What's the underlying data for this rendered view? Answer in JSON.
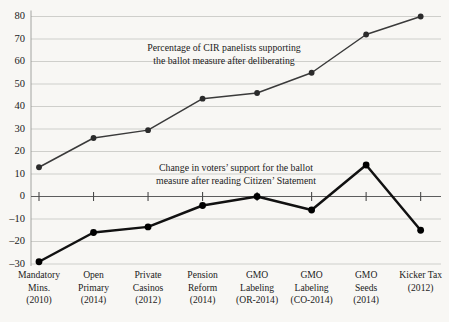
{
  "chart_data": {
    "type": "line",
    "title": "",
    "xlabel": "",
    "ylabel": "",
    "ylim": [
      -30,
      80
    ],
    "ytick_step": 10,
    "grid": true,
    "legend_position": "inline-annotations",
    "categories": [
      "Mandatory Mins. (2010)",
      "Open Primary (2014)",
      "Private Casinos (2012)",
      "Pension Reform (2014)",
      "GMO Labeling (OR-2014)",
      "GMO Labeling (CO-2014)",
      "GMO Seeds (2014)",
      "Kicker Tax (2012)"
    ],
    "category_lines": [
      [
        "Mandatory",
        "Mins.",
        "(2010)"
      ],
      [
        "Open",
        "Primary",
        "(2014)"
      ],
      [
        "Private",
        "Casinos",
        "(2012)"
      ],
      [
        "Pension",
        "Reform",
        "(2014)"
      ],
      [
        "GMO",
        "Labeling",
        "(OR-2014)"
      ],
      [
        "GMO",
        "Labeling",
        "(CO-2014)"
      ],
      [
        "GMO",
        "Seeds",
        "(2014)"
      ],
      [
        "Kicker Tax",
        "(2012)",
        ""
      ]
    ],
    "yticks": [
      80,
      70,
      60,
      50,
      40,
      30,
      20,
      10,
      0,
      -10,
      -20,
      -30
    ],
    "ytick_labels": [
      "80",
      "70",
      "60",
      "50",
      "40",
      "30",
      "20",
      "10",
      "0",
      "–10",
      "–20",
      "–30"
    ],
    "series": [
      {
        "name": "Percentage of CIR panelists supporting the ballot measure after deliberating",
        "values": [
          13,
          26,
          29.5,
          43.5,
          46,
          55,
          72,
          80
        ],
        "color": "#3a3a3a"
      },
      {
        "name": "Change in voters' support for the ballot measure after reading Citizen' Statement",
        "values": [
          -29,
          -16,
          -13.5,
          -4,
          0,
          -6,
          14,
          -15
        ],
        "color": "#111111"
      }
    ],
    "annotations": [
      {
        "id": "upper-series-annotation",
        "lines": [
          "Percentage of CIR panelists supporting",
          "the ballot measure after deliberating"
        ]
      },
      {
        "id": "lower-series-annotation",
        "lines": [
          "Change in voters’ support for the ballot",
          "measure after reading Citizen’ Statement"
        ]
      }
    ]
  },
  "colors": {
    "background": "#f8f7f4",
    "grid": "#c9c9c6",
    "zero_axis": "#5d5d5d",
    "upper_series": "#3a3a3a",
    "lower_series": "#111111"
  }
}
